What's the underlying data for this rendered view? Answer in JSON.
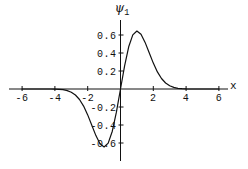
{
  "figure": {
    "title": {
      "symbol": "ψ",
      "subscript": "1"
    },
    "x_axis_label": "x"
  },
  "chart_data": {
    "type": "line",
    "xlabel": "x",
    "ylabel": "ψ₁",
    "xlim": [
      -6.6,
      6.6
    ],
    "ylim": [
      -0.72,
      0.72
    ],
    "grid": false,
    "legend": false,
    "axis_style": "axes-through-origin",
    "axis_color": "#111111",
    "background": "#ffffff",
    "x_ticks": [
      {
        "value": -6,
        "label": "-6"
      },
      {
        "value": -4,
        "label": "-4"
      },
      {
        "value": -2,
        "label": "-2"
      },
      {
        "value": 2,
        "label": "2"
      },
      {
        "value": 4,
        "label": "4"
      },
      {
        "value": 6,
        "label": "6"
      }
    ],
    "y_ticks": [
      {
        "value": 0.6,
        "label": "0.6"
      },
      {
        "value": 0.4,
        "label": "0.4"
      },
      {
        "value": 0.2,
        "label": "0.2"
      },
      {
        "value": -0.2,
        "label": "-0.2"
      },
      {
        "value": -0.4,
        "label": "-0.4"
      },
      {
        "value": -0.6,
        "label": "-0.6"
      }
    ],
    "series": [
      {
        "name": "ψ₁",
        "color": "#111111",
        "x": [
          -6,
          -5.75,
          -5.5,
          -5.25,
          -5,
          -4.75,
          -4.5,
          -4.25,
          -4,
          -3.75,
          -3.5,
          -3.25,
          -3,
          -2.75,
          -2.5,
          -2.25,
          -2,
          -1.75,
          -1.5,
          -1.25,
          -1,
          -0.75,
          -0.5,
          -0.25,
          0,
          0.25,
          0.5,
          0.75,
          1,
          1.25,
          1.5,
          1.75,
          2,
          2.25,
          2.5,
          2.75,
          3,
          3.25,
          3.5,
          3.75,
          4,
          4.25,
          4.5,
          4.75,
          5,
          5.25,
          5.5,
          5.75,
          6
        ],
        "y": [
          0,
          0,
          0,
          0,
          0,
          -0.0001,
          -0.0002,
          -0.0005,
          -0.0014,
          -0.0035,
          -0.0081,
          -0.0176,
          -0.0354,
          -0.0666,
          -0.1167,
          -0.1902,
          -0.2875,
          -0.4019,
          -0.5173,
          -0.6079,
          -0.6443,
          -0.6014,
          -0.4687,
          -0.2574,
          0,
          0.2574,
          0.4687,
          0.6014,
          0.6443,
          0.6079,
          0.5173,
          0.4019,
          0.2875,
          0.1902,
          0.1167,
          0.0666,
          0.0354,
          0.0176,
          0.0081,
          0.0035,
          0.0014,
          0.0005,
          0.0002,
          0.0001,
          0,
          0,
          0,
          0,
          0
        ]
      }
    ]
  }
}
